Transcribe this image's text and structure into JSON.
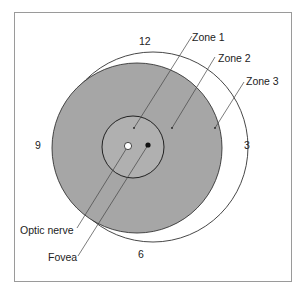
{
  "diagram": {
    "title": "",
    "clock_labels": {
      "top": "12",
      "right": "3",
      "bottom": "6",
      "left": "9"
    },
    "zone_labels": [
      "Zone 1",
      "Zone 2",
      "Zone 3"
    ],
    "structure_labels": {
      "optic_nerve": "Optic nerve",
      "fovea": "Fovea"
    },
    "colors": {
      "frame": "#9a9a9a",
      "outline": "#333333",
      "zone2_fill": "#a6a6a6",
      "zone1_fill": "#b3b3b3",
      "background": "#ffffff",
      "optic_nerve_fill": "#ffffff",
      "fovea_fill": "#111111"
    }
  }
}
